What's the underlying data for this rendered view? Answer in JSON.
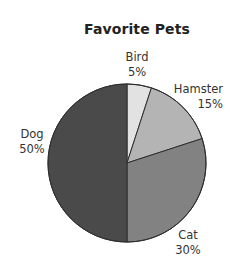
{
  "chart_data": {
    "type": "pie",
    "title": "Favorite Pets",
    "categories": [
      "Bird",
      "Hamster",
      "Cat",
      "Dog"
    ],
    "values": [
      5,
      15,
      30,
      50
    ],
    "value_labels": [
      "5%",
      "15%",
      "30%",
      "50%"
    ],
    "colors": [
      "#e2e2e2",
      "#b4b4b4",
      "#828282",
      "#4a4a4a"
    ],
    "start_angle_deg": 0,
    "direction": "clockwise",
    "legend": "none",
    "labels_outside": true
  },
  "labels": {
    "bird": {
      "name": "Bird",
      "pct": "5%"
    },
    "hamster": {
      "name": "Hamster",
      "pct": "15%"
    },
    "cat": {
      "name": "Cat",
      "pct": "30%"
    },
    "dog": {
      "name": "Dog",
      "pct": "50%"
    }
  }
}
